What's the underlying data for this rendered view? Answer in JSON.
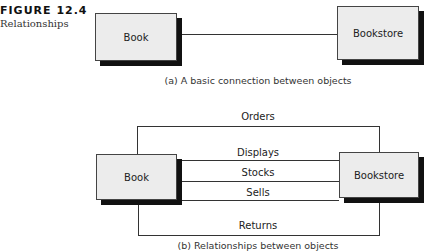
{
  "figure": {
    "number": "FIGURE 12.4",
    "title": "Relationships"
  },
  "diagram_a": {
    "left_object": "Book",
    "right_object": "Bookstore",
    "caption": "(a) A basic connection between objects"
  },
  "diagram_b": {
    "left_object": "Book",
    "right_object": "Bookstore",
    "relationships": [
      "Orders",
      "Displays",
      "Stocks",
      "Sells",
      "Returns"
    ],
    "caption": "(b) Relationships between objects"
  }
}
